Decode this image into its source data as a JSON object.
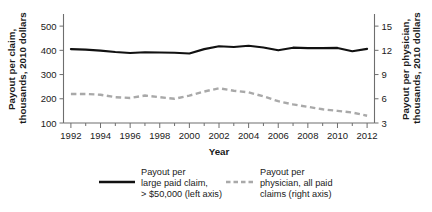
{
  "chart_data": {
    "type": "line",
    "title": "",
    "xlabel": "Year",
    "ylabel": "Payout per claim, thousands, 2010 dollars",
    "y2label": "Payout per physician, thousands, 2010 dollars",
    "x": [
      1992,
      1993,
      1994,
      1995,
      1996,
      1997,
      1998,
      1999,
      2000,
      2001,
      2002,
      2003,
      2004,
      2005,
      2006,
      2007,
      2008,
      2009,
      2010,
      2011,
      2012
    ],
    "xlim": [
      1991.5,
      2012.5
    ],
    "xticks": [
      1992,
      1994,
      1996,
      1998,
      2000,
      2002,
      2004,
      2006,
      2008,
      2010,
      2012
    ],
    "xticklabels": [
      "1992",
      "1994",
      "1996",
      "1998",
      "2000",
      "2002",
      "2004",
      "2006",
      "2008",
      "2010",
      "2012"
    ],
    "xminorticks": [
      1993,
      1995,
      1997,
      1999,
      2001,
      2003,
      2005,
      2007,
      2009,
      2011
    ],
    "ylim": [
      100,
      550
    ],
    "yticks": [
      100,
      200,
      300,
      400,
      500
    ],
    "yticklabels": [
      "100",
      "200",
      "300",
      "400",
      "500"
    ],
    "y2lim": [
      3,
      16.5
    ],
    "y2ticks": [
      3,
      6,
      9,
      12,
      15
    ],
    "y2ticklabels": [
      "3",
      "6",
      "9",
      "12",
      "15"
    ],
    "grid": false,
    "legend_position": "bottom",
    "series": [
      {
        "name": "Payout per large paid claim, > $50,000 (left axis)",
        "axis": "left",
        "style": "solid",
        "color": "#111111",
        "values": [
          405,
          403,
          399,
          393,
          389,
          392,
          391,
          390,
          387,
          405,
          417,
          414,
          419,
          412,
          400,
          411,
          409,
          409,
          410,
          396,
          406
        ]
      },
      {
        "name": "Payout per physician, all paid claims (right axis)",
        "axis": "right",
        "style": "dashed",
        "color": "#a9a9a9",
        "values": [
          6.6,
          6.6,
          6.5,
          6.2,
          6.1,
          6.4,
          6.2,
          6.0,
          6.4,
          6.9,
          7.3,
          7.0,
          6.8,
          6.3,
          5.7,
          5.3,
          5.0,
          4.7,
          4.5,
          4.3,
          3.9
        ]
      }
    ]
  },
  "legend": {
    "items": [
      {
        "label_lines": [
          "Payout per",
          "large paid claim,",
          "> $50,000 (left axis)"
        ],
        "style": "solid"
      },
      {
        "label_lines": [
          "Payout per",
          "physician, all paid",
          "claims (right axis)"
        ],
        "style": "dashed"
      }
    ]
  }
}
